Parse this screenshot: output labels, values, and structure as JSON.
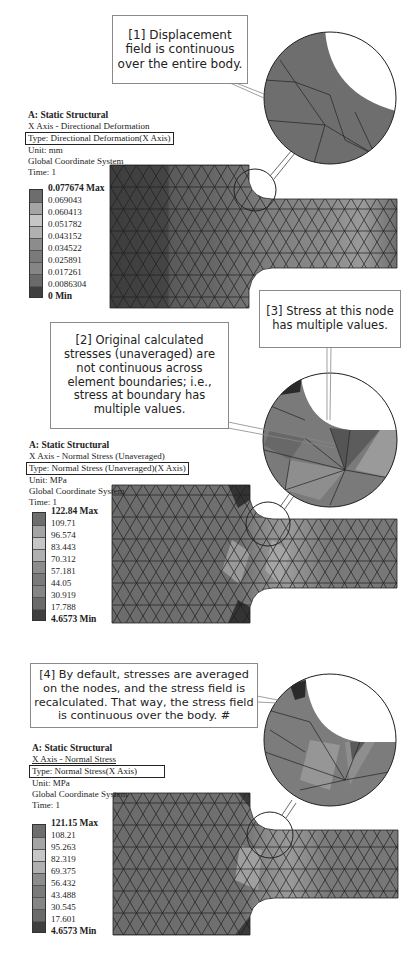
{
  "figures": [
    {
      "id": "directional-deformation",
      "header": {
        "title": "A: Static Structural",
        "subtitle": "X Axis - Directional Deformation",
        "type": "Type: Directional Deformation(X Axis)",
        "unit": "Unit: mm",
        "coord": "Global Coordinate System",
        "time": "Time: 1"
      },
      "legend": {
        "max": "0.077674 Max",
        "values": [
          "0.069043",
          "0.060413",
          "0.051782",
          "0.043152",
          "0.034522",
          "0.025891",
          "0.017261",
          "0.0086304"
        ],
        "min": "0 Min",
        "colors": [
          "#6d6d6d",
          "#a4a4a4",
          "#c6c6c6",
          "#b0b0b0",
          "#8c8c8c",
          "#7a7a7a",
          "#858585",
          "#6a6a6a",
          "#3f3f3f"
        ]
      },
      "callouts": [
        {
          "id": "1",
          "text": "[1] Displacement field is continuous over the entire body."
        }
      ]
    },
    {
      "id": "normal-stress-unaveraged",
      "header": {
        "title": "A: Static Structural",
        "subtitle": "X Axis - Normal Stress (Unaveraged)",
        "type": "Type: Normal Stress (Unaveraged)(X Axis)",
        "unit": "Unit: MPa",
        "coord": "Global Coordinate System",
        "time": "Time: 1"
      },
      "legend": {
        "max": "122.84 Max",
        "values": [
          "109.71",
          "96.574",
          "83.443",
          "70.312",
          "57.181",
          "44.05",
          "30.919",
          "17.788"
        ],
        "min": "4.6573 Min",
        "colors": [
          "#6d6d6d",
          "#a4a4a4",
          "#c6c6c6",
          "#b0b0b0",
          "#8c8c8c",
          "#7a7a7a",
          "#858585",
          "#6a6a6a",
          "#3f3f3f"
        ]
      },
      "callouts": [
        {
          "id": "2",
          "text": "[2] Original calculated stresses (unaveraged) are not continuous across element boundaries; i.e., stress at boundary has multiple values."
        },
        {
          "id": "3",
          "text": "[3] Stress at this node has multiple values."
        }
      ]
    },
    {
      "id": "normal-stress-averaged",
      "header": {
        "title": "A: Static Structural",
        "subtitle": "X Axis - Normal Stress",
        "type": "Type: Normal Stress(X Axis)",
        "unit": "Unit: MPa",
        "coord": "Global Coordinate System",
        "time": "Time: 1"
      },
      "legend": {
        "max": "121.15 Max",
        "values": [
          "108.21",
          "95.263",
          "82.319",
          "69.375",
          "56.432",
          "43.488",
          "30.545",
          "17.601"
        ],
        "min": "4.6573 Min",
        "colors": [
          "#6d6d6d",
          "#a4a4a4",
          "#c6c6c6",
          "#b0b0b0",
          "#8c8c8c",
          "#7a7a7a",
          "#858585",
          "#6a6a6a",
          "#3f3f3f"
        ]
      },
      "callouts": [
        {
          "id": "4",
          "text": "[4] By default, stresses are averaged on the nodes, and the stress field is recalculated. That way, the stress field is continuous over the body. #"
        }
      ]
    }
  ]
}
